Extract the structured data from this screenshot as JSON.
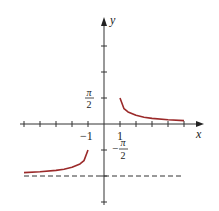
{
  "chart_data": {
    "type": "line",
    "title": "",
    "xlabel": "x",
    "ylabel": "y",
    "xlim": [
      -5.5,
      6
    ],
    "ylim": [
      -3.8,
      4.0
    ],
    "x_ticks": [
      -5,
      -4,
      -3,
      -2,
      -1,
      1,
      2,
      3,
      4,
      5
    ],
    "x_tick_labels": [
      {
        "value": -1,
        "label": "−1"
      },
      {
        "value": 1,
        "label": "1"
      }
    ],
    "y_ticks_units_of_pi_over_2": [
      -3,
      -2,
      -1,
      1,
      2,
      3
    ],
    "y_tick_labels": [
      {
        "value": 1.5708,
        "num": "π",
        "den": "2",
        "sign": ""
      },
      {
        "value": -1.5708,
        "num": "π",
        "den": "2",
        "sign": "−"
      }
    ],
    "grid": false,
    "series": [
      {
        "name": "right branch (x ≥ 1)",
        "color": "#9b2a2a",
        "points": [
          [
            1,
            1.5708
          ],
          [
            1.25,
            0.927
          ],
          [
            1.5,
            0.73
          ],
          [
            2,
            0.524
          ],
          [
            2.5,
            0.412
          ],
          [
            3,
            0.34
          ],
          [
            4,
            0.253
          ],
          [
            5,
            0.201
          ]
        ]
      },
      {
        "name": "left branch (x ≤ −1)",
        "color": "#9b2a2a",
        "points": [
          [
            -5,
            -2.94
          ],
          [
            -4,
            -2.889
          ],
          [
            -3,
            -2.802
          ],
          [
            -2.5,
            -2.73
          ],
          [
            -2,
            -2.618
          ],
          [
            -1.5,
            -2.412
          ],
          [
            -1.25,
            -2.214
          ],
          [
            -1,
            -1.5708
          ]
        ]
      }
    ],
    "asymptote": {
      "y": -3.1416,
      "style": "dashed",
      "x_range": [
        -5,
        5
      ]
    }
  }
}
